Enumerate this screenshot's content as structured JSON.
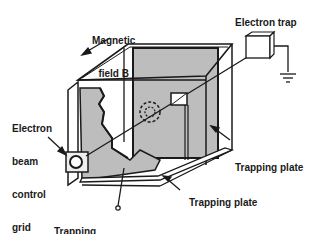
{
  "diagram": {
    "labels": {
      "magnetic_field_line1": "Magnetic",
      "magnetic_field_line2": "field B",
      "electron_trap": "Electron trap",
      "grid_line1": "Electron",
      "grid_line2": "beam",
      "grid_line3": "control",
      "grid_line4": "grid",
      "trapping_plate_right": "Trapping plate",
      "trapping_plate_bottom": "Trapping plate",
      "trapping_voltage_line1": "Trapping",
      "trapping_voltage_line2": "voltage"
    },
    "colors": {
      "plate_fill": "#bdbdbd",
      "line": "#1a1a1a",
      "background": "#ffffff"
    }
  }
}
